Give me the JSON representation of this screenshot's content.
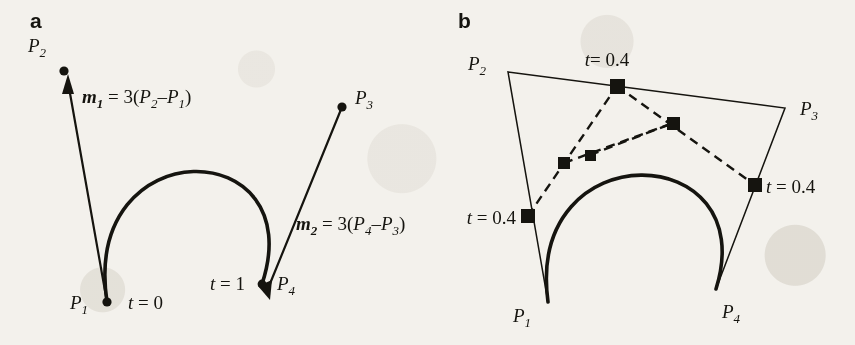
{
  "figure": {
    "kind": "cubic-bezier-hermite-construction",
    "background_color": "#f3f1ec",
    "ink_color": "#15140f",
    "width": 855,
    "height": 345
  },
  "panels": [
    {
      "id": "a",
      "letter": "a",
      "caption_note": "Hermite tangent vectors at the endpoints of a cubic curve",
      "points": [
        {
          "name": "P1",
          "base": "P",
          "sub": "1",
          "x": 107,
          "y": 302,
          "label_x": 72,
          "label_y": 307,
          "marker": "dot"
        },
        {
          "name": "P2",
          "base": "P",
          "sub": "2",
          "x": 64,
          "y": 71,
          "label_x": 28,
          "label_y": 52,
          "marker": "dot"
        },
        {
          "name": "P3",
          "base": "P",
          "sub": "3",
          "x": 342,
          "y": 107,
          "label_x": 355,
          "label_y": 104,
          "marker": "dot"
        },
        {
          "name": "P4",
          "base": "P",
          "sub": "4",
          "x": 262,
          "y": 284,
          "label_x": 277,
          "label_y": 288,
          "marker": "dot"
        }
      ],
      "tangents": [
        {
          "name": "m1",
          "base": "m",
          "sub": "1",
          "equation_lhs": "m",
          "equation_lhs_sub": "1",
          "equation_text": "= 3(P2−P1)",
          "scalar": "3",
          "from": "P1",
          "to": "P2",
          "arrow_at": "P2",
          "label_x": 82,
          "label_y": 100,
          "label_parts": {
            "var": "m",
            "var_sub": "1",
            "eq": " = 3(",
            "a": "P",
            "a_sub": "2",
            "minus": "–",
            "b": "P",
            "b_sub": "1",
            "close": ")"
          }
        },
        {
          "name": "m2",
          "base": "m",
          "sub": "2",
          "equation_lhs": "m",
          "equation_lhs_sub": "2",
          "equation_text": "= 3(P4−P3)",
          "scalar": "3",
          "from": "P3",
          "to": "P4",
          "arrow_at": "P4",
          "label_x": 296,
          "label_y": 227,
          "label_parts": {
            "var": "m",
            "var_sub": "2",
            "eq": " = 3(",
            "a": "P",
            "a_sub": "4",
            "minus": "–",
            "b": "P",
            "b_sub": "3",
            "close": ")"
          }
        }
      ],
      "parameter_labels": [
        {
          "text_var": "t",
          "text_eq": " = 0",
          "value": "0",
          "x": 128,
          "y": 307,
          "anchor": "start"
        },
        {
          "text_var": "t",
          "text_eq": " = 1",
          "value": "1",
          "x": 245,
          "y": 288,
          "anchor": "end"
        }
      ],
      "curve": {
        "type": "cubic-bezier",
        "p0": [
          107,
          302
        ],
        "c1": [
          81,
          128
        ],
        "c2": [
          312,
          134
        ],
        "p3": [
          262,
          284
        ]
      }
    },
    {
      "id": "b",
      "letter": "b",
      "caption_note": "de Casteljau subdivision of the same curve at t = 0.4",
      "points": [
        {
          "name": "P1",
          "base": "P",
          "sub": "1",
          "x": 548,
          "y": 302,
          "label_x": 515,
          "label_y": 318,
          "marker": "none"
        },
        {
          "name": "P2",
          "base": "P",
          "sub": "2",
          "x": 508,
          "y": 72,
          "label_x": 470,
          "label_y": 68,
          "marker": "none"
        },
        {
          "name": "P3",
          "base": "P",
          "sub": "3",
          "x": 785,
          "y": 108,
          "label_x": 800,
          "label_y": 113,
          "marker": "none"
        },
        {
          "name": "P4",
          "base": "P",
          "sub": "4",
          "x": 716,
          "y": 289,
          "label_x": 724,
          "label_y": 315,
          "marker": "none"
        }
      ],
      "hull_polyline": [
        [
          548,
          302
        ],
        [
          508,
          72
        ],
        [
          785,
          108
        ],
        [
          716,
          289
        ]
      ],
      "construction_points": [
        {
          "name": "Q1",
          "x": 528,
          "y": 216,
          "on": "P1-P2",
          "t": 0.4,
          "marker": "square"
        },
        {
          "name": "Q2",
          "x": 617,
          "y": 86,
          "on": "P2-P3",
          "t": 0.4,
          "marker": "square"
        },
        {
          "name": "Q3",
          "x": 755,
          "y": 185,
          "on": "P3-P4",
          "t": 0.4,
          "marker": "square"
        },
        {
          "name": "R1",
          "x": 564,
          "y": 163,
          "on": "Q1-Q2",
          "t": 0.4,
          "marker": "square"
        },
        {
          "name": "R2",
          "x": 673,
          "y": 123,
          "on": "Q2-Q3",
          "t": 0.4,
          "marker": "square"
        },
        {
          "name": "S1",
          "x": 590,
          "y": 155,
          "on": "R1-R2",
          "t": 0.4,
          "marker": "square"
        }
      ],
      "dashed_segments": [
        [
          [
            528,
            216
          ],
          [
            617,
            86
          ]
        ],
        [
          [
            617,
            86
          ],
          [
            755,
            185
          ]
        ],
        [
          [
            564,
            163
          ],
          [
            673,
            123
          ]
        ],
        [
          [
            590,
            155
          ],
          [
            673,
            123
          ]
        ]
      ],
      "parameter_labels": [
        {
          "text_var": "t",
          "text_eq": "= 0.4",
          "value": "0.4",
          "x": 607,
          "y": 66,
          "anchor": "middle"
        },
        {
          "text_var": "t",
          "text_eq": " = 0.4",
          "value": "0.4",
          "x": 518,
          "y": 224,
          "anchor": "end"
        },
        {
          "text_var": "t",
          "text_eq": " = 0.4",
          "value": "0.4",
          "x": 766,
          "y": 192,
          "anchor": "start"
        }
      ],
      "curve": {
        "type": "cubic-bezier",
        "p0": [
          548,
          302
        ],
        "c1": [
          525,
          131
        ],
        "c2": [
          763,
          139
        ],
        "p3": [
          716,
          289
        ]
      }
    }
  ]
}
